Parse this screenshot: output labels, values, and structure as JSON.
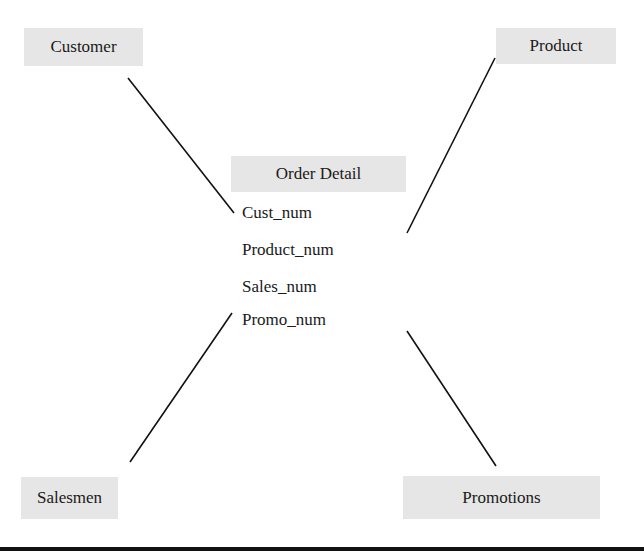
{
  "entities": {
    "customer": "Customer",
    "product": "Product",
    "salesmen": "Salesmen",
    "promotions": "Promotions"
  },
  "center": {
    "title": "Order Detail",
    "fields": [
      "Cust_num",
      "Product_num",
      "Sales_num",
      "Promo_num"
    ]
  },
  "colors": {
    "box_fill": "#e6e6e6",
    "line": "#111111"
  }
}
